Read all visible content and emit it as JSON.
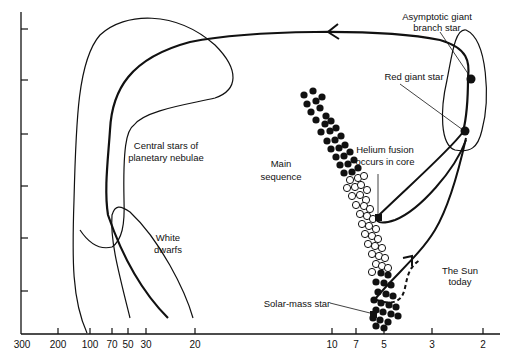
{
  "diagram": {
    "x_axis": {
      "tick_labels": [
        "300",
        "200",
        "100",
        "70",
        "50",
        "30",
        "20",
        "10",
        "7",
        "5",
        "3",
        "2"
      ],
      "direction": "decreasing-right"
    },
    "y_axis": {
      "tick_count": 6,
      "tick_labels": []
    },
    "labels": {
      "agb_line1": "Asymptotic giant",
      "agb_line2": "branch star",
      "red_giant": "Red giant star",
      "helium_line1": "Helium fusion",
      "helium_line2": "occurs in core",
      "main_seq_line1": "Main",
      "main_seq_line2": "sequence",
      "central_line1": "Central stars of",
      "central_line2": "planetary nebulae",
      "white_dwarfs_line1": "White",
      "white_dwarfs_line2": "dwarfs",
      "sun_line1": "The Sun",
      "sun_line2": "today",
      "solar_mass": "Solar-mass star"
    },
    "regions": [
      "main-sequence",
      "red-giant-branch",
      "horizontal-branch-helium-fusion",
      "asymptotic-giant-branch",
      "central-stars-of-planetary-nebulae",
      "white-dwarfs"
    ],
    "star_markers": [
      "solar-mass-star",
      "helium-fusion-point",
      "red-giant-star",
      "agb-star"
    ],
    "colors": {
      "ink": "#111111",
      "background": "#ffffff"
    }
  }
}
